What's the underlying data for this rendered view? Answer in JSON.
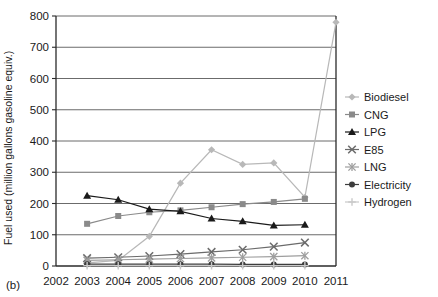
{
  "panel": {
    "label": "(b)"
  },
  "axes": {
    "ylabel": "Fuel used (million gallons gasoline equiv.)",
    "xlabel": "",
    "yticks": [
      "0",
      "100",
      "200",
      "300",
      "400",
      "500",
      "600",
      "700",
      "800"
    ],
    "xticks": [
      "2002",
      "2003",
      "2004",
      "2005",
      "2006",
      "2007",
      "2008",
      "2009",
      "2010",
      "2011"
    ]
  },
  "legend": {
    "items": [
      {
        "label": "Biodiesel",
        "marker": "diamond",
        "color": "#b8b8b8"
      },
      {
        "label": "CNG",
        "marker": "square",
        "color": "#8a8a8a"
      },
      {
        "label": "LPG",
        "marker": "triangle",
        "color": "#1a1a1a"
      },
      {
        "label": "E85",
        "marker": "cross",
        "color": "#6b6b6b"
      },
      {
        "label": "LNG",
        "marker": "star",
        "color": "#9e9e9e"
      },
      {
        "label": "Electricity",
        "marker": "circle",
        "color": "#3d3d3d"
      },
      {
        "label": "Hydrogen",
        "marker": "plus",
        "color": "#c9c9c9"
      }
    ]
  },
  "chart_data": {
    "type": "line",
    "title": "",
    "xlabel": "",
    "ylabel": "Fuel used (million gallons gasoline equiv.)",
    "xlim": [
      2002,
      2011
    ],
    "ylim": [
      0,
      800
    ],
    "grid": true,
    "legend_position": "right",
    "x": [
      2003,
      2004,
      2005,
      2006,
      2007,
      2008,
      2009,
      2010,
      2011
    ],
    "series": [
      {
        "name": "Biodiesel",
        "marker": "diamond",
        "color": "#b8b8b8",
        "x": [
          2003,
          2004,
          2005,
          2006,
          2007,
          2008,
          2009,
          2010,
          2011
        ],
        "values": [
          10,
          18,
          95,
          265,
          372,
          325,
          330,
          220,
          780
        ]
      },
      {
        "name": "CNG",
        "marker": "square",
        "color": "#8a8a8a",
        "x": [
          2003,
          2004,
          2005,
          2006,
          2007,
          2008,
          2009,
          2010
        ],
        "values": [
          135,
          160,
          172,
          178,
          188,
          198,
          205,
          215
        ]
      },
      {
        "name": "LPG",
        "marker": "triangle",
        "color": "#1a1a1a",
        "x": [
          2003,
          2004,
          2005,
          2006,
          2007,
          2008,
          2009,
          2010
        ],
        "values": [
          225,
          212,
          182,
          175,
          152,
          143,
          130,
          132
        ]
      },
      {
        "name": "E85",
        "marker": "cross",
        "color": "#6b6b6b",
        "x": [
          2003,
          2004,
          2005,
          2006,
          2007,
          2008,
          2009,
          2010
        ],
        "values": [
          25,
          28,
          32,
          38,
          45,
          52,
          62,
          75
        ]
      },
      {
        "name": "LNG",
        "marker": "star",
        "color": "#9e9e9e",
        "x": [
          2003,
          2004,
          2005,
          2006,
          2007,
          2008,
          2009,
          2010
        ],
        "values": [
          18,
          20,
          22,
          24,
          26,
          28,
          30,
          33
        ]
      },
      {
        "name": "Electricity",
        "marker": "circle",
        "color": "#3d3d3d",
        "x": [
          2003,
          2004,
          2005,
          2006,
          2007,
          2008,
          2009,
          2010
        ],
        "values": [
          6,
          6,
          6,
          6,
          6,
          5,
          5,
          5
        ]
      },
      {
        "name": "Hydrogen",
        "marker": "plus",
        "color": "#c9c9c9",
        "x": [
          2003,
          2004,
          2005,
          2006,
          2007,
          2008,
          2009,
          2010
        ],
        "values": [
          1,
          1,
          1,
          1,
          1,
          1,
          1,
          1
        ]
      }
    ]
  }
}
